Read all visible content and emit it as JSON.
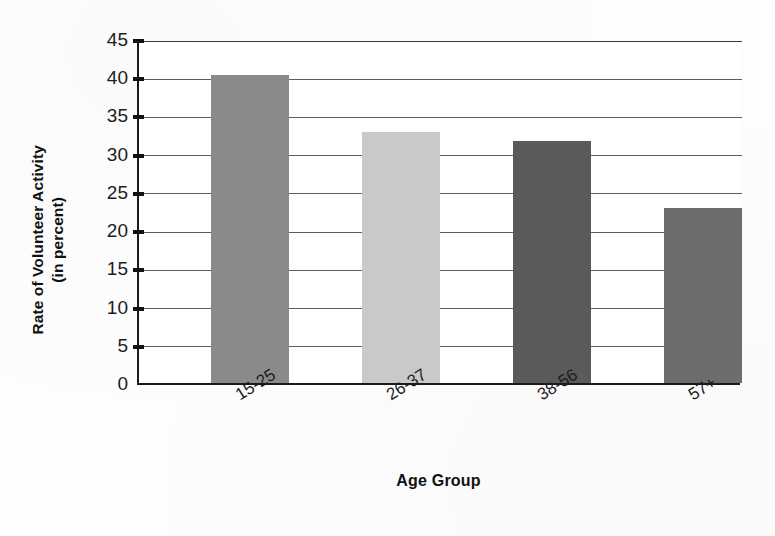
{
  "chart_data": {
    "type": "bar",
    "title": "",
    "xlabel": "Age Group",
    "ylabel": "Rate of Volunteer Activity (in percent)",
    "ylabel_lines": [
      "Rate of Volunteer Activity",
      "(in percent)"
    ],
    "categories": [
      "15-25",
      "26-37",
      "38-56",
      "57+"
    ],
    "values": [
      40.3,
      32.9,
      31.6,
      22.9
    ],
    "ylim": [
      0,
      45
    ],
    "ytick_step": 5,
    "yticks": [
      0,
      5,
      10,
      15,
      20,
      25,
      30,
      35,
      40,
      45
    ],
    "ytick_labels": [
      "0",
      "5",
      "10",
      "15",
      "20",
      "25",
      "30",
      "35",
      "40",
      "45"
    ],
    "grid": true,
    "grid_axis": "y",
    "legend": false,
    "legend_position": "none",
    "bar_colors": [
      "#8a8a8a",
      "#c9c9c9",
      "#5a5a5a",
      "#6d6d6d"
    ],
    "xtick_label_rotation": -32,
    "series": [
      {
        "name": "Rate of Volunteer Activity",
        "values": [
          40.3,
          32.9,
          31.6,
          22.9
        ]
      }
    ]
  }
}
